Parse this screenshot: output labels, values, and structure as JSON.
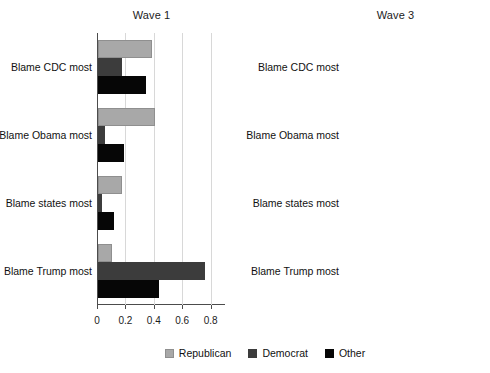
{
  "chart_data": {
    "type": "bar",
    "orientation": "horizontal",
    "title": "",
    "xlabel": "",
    "ylabel": "",
    "xlim": [
      0,
      0.88
    ],
    "grid": true,
    "legend_position": "bottom-center",
    "categories": [
      "Blame CDC most",
      "Blame Obama most",
      "Blame states most",
      "Blame Trump most"
    ],
    "tick_labels": [
      "0",
      "0.2",
      "0.4",
      "0.6",
      "0.8"
    ],
    "tick_values": [
      0,
      0.2,
      0.4,
      0.6,
      0.8
    ],
    "legend": [
      "Republican",
      "Democrat",
      "Other"
    ],
    "colors": {
      "republican": "#a8a8a8",
      "democrat": "#3c3c3c",
      "other": "#060606"
    },
    "panels": [
      {
        "title": "Wave 1",
        "series": [
          {
            "name": "Republican",
            "values": [
              0.38,
              0.4,
              0.17,
              0.1
            ]
          },
          {
            "name": "Democrat",
            "values": [
              0.17,
              0.05,
              0.03,
              0.75
            ]
          },
          {
            "name": "Other",
            "values": [
              0.34,
              0.18,
              0.11,
              0.43
            ]
          }
        ]
      },
      {
        "title": "Wave 3",
        "series": [
          {
            "name": "Republican",
            "values": [
              0.46,
              0.34,
              0.16,
              0.1
            ]
          },
          {
            "name": "Democrat",
            "values": [
              0.1,
              0.04,
              0.06,
              0.81
            ]
          },
          {
            "name": "Other",
            "values": [
              0.28,
              0.17,
              0.1,
              0.48
            ]
          }
        ]
      }
    ]
  },
  "panel_left": {
    "title": "Wave 1"
  },
  "panel_right": {
    "title": "Wave 3"
  }
}
